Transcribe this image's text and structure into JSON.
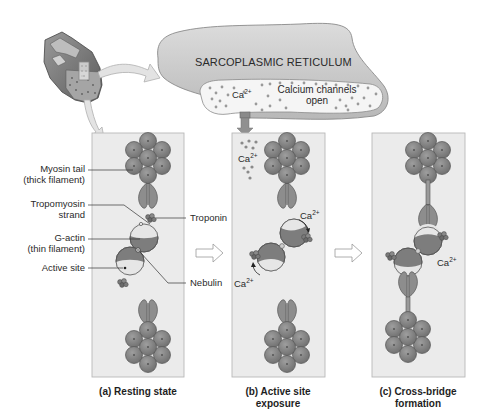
{
  "figure": {
    "sarcoplasmic_reticulum": {
      "title": "SARCOPLASMIC RETICULUM",
      "channel_label_line1": "Calcium channels",
      "channel_label_line2": "open",
      "ion_label": "Ca",
      "ion_charge": "2+"
    },
    "labels": {
      "myosin_tail_line1": "Myosin tail",
      "myosin_tail_line2": "(thick filament)",
      "tropomyosin_line1": "Tropomyosin",
      "tropomyosin_line2": "strand",
      "g_actin_line1": "G-actin",
      "g_actin_line2": "(thin filament)",
      "active_site": "Active site",
      "troponin": "Troponin",
      "nebulin": "Nebulin"
    },
    "panels": [
      {
        "id": "a",
        "caption_line1": "(a) Resting state",
        "caption_line2": ""
      },
      {
        "id": "b",
        "caption_line1": "(b) Active site",
        "caption_line2": "exposure"
      },
      {
        "id": "c",
        "caption_line1": "(c) Cross-bridge",
        "caption_line2": "formation"
      }
    ],
    "ion_labels": {
      "b_top": {
        "text": "Ca",
        "charge": "2+"
      },
      "b_upper_right": {
        "text": "Ca",
        "charge": "2+"
      },
      "b_lower_left": {
        "text": "Ca",
        "charge": "2+"
      },
      "c_right": {
        "text": "Ca",
        "charge": "2+"
      }
    },
    "colors": {
      "panel_fill": "#ebebeb",
      "panel_border": "#b5b5b5",
      "myosin_head": "#8a8a8a",
      "actin_dark": "#7d7d7d",
      "actin_light": "#e6e6e6",
      "sr_fill": "#c9c9c9",
      "sr_lumen": "#f4f4f4",
      "arrow_fill": "#e6e6e6"
    }
  }
}
